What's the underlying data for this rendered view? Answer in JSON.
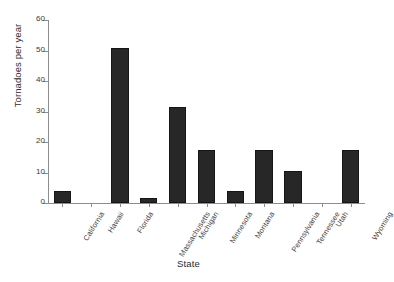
{
  "chart_data": {
    "type": "bar",
    "title": "",
    "xlabel": "State",
    "ylabel": "Tornadoes per year",
    "categories": [
      "California",
      "Hawaii",
      "Florida",
      "Massachusetts",
      "Michigan",
      "Minnesota",
      "Montana",
      "Pennsylvania",
      "Tennessee",
      "Utah",
      "Wyoming"
    ],
    "values": [
      4,
      0,
      50.8,
      1.8,
      31.5,
      17.5,
      4,
      17.5,
      10.5,
      0,
      17.3
    ],
    "ylim": [
      0,
      60
    ],
    "yticks": [
      0,
      10,
      20,
      30,
      40,
      50,
      60
    ],
    "ytick_labels": [
      "0",
      "10",
      "20",
      "30",
      "40",
      "50",
      "60"
    ],
    "grid": false,
    "legend": "none",
    "bar_color": "#272727",
    "axis_color": "#8d8d8d"
  }
}
